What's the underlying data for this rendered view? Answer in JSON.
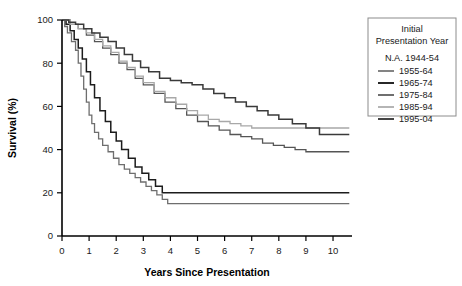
{
  "chart_data": {
    "type": "line",
    "title": "",
    "xlabel": "Years Since Presentation",
    "ylabel": "Survival (%)",
    "xlim": [
      0,
      10.7
    ],
    "ylim": [
      0,
      100
    ],
    "xticks": [
      "0",
      "1",
      "2",
      "3",
      "4",
      "5",
      "6",
      "7",
      "8",
      "9",
      "10"
    ],
    "yticks": [
      "0",
      "20",
      "40",
      "60",
      "80",
      "100"
    ],
    "grid": false,
    "legend_position": "right-outside",
    "legend_title_line1": "Initial",
    "legend_title_line2": "Presentation Year",
    "na_entry": "N.A. 1944-54",
    "series": [
      {
        "name": "1955-64",
        "color": "#6e6e6e",
        "width": 1.3,
        "final_value": 15,
        "x": [
          0,
          0.1,
          0.2,
          0.35,
          0.5,
          0.6,
          0.7,
          0.8,
          0.9,
          1.0,
          1.1,
          1.2,
          1.35,
          1.5,
          1.7,
          1.9,
          2.1,
          2.3,
          2.5,
          2.7,
          2.9,
          3.1,
          3.3,
          3.5,
          3.7,
          3.9,
          10.6
        ],
        "y": [
          100,
          97,
          94,
          90,
          86,
          80,
          74,
          68,
          62,
          56,
          52,
          48,
          45,
          42,
          39,
          36,
          33,
          31,
          29,
          27,
          25,
          23,
          21,
          19,
          17,
          15,
          15
        ]
      },
      {
        "name": "1965-74",
        "color": "#1c1c1c",
        "width": 1.5,
        "final_value": 20,
        "x": [
          0,
          0.15,
          0.3,
          0.45,
          0.6,
          0.75,
          0.9,
          1.05,
          1.2,
          1.4,
          1.6,
          1.8,
          2.0,
          2.2,
          2.45,
          2.7,
          2.95,
          3.2,
          3.45,
          3.7,
          10.6
        ],
        "y": [
          100,
          98,
          95,
          91,
          87,
          82,
          76,
          70,
          64,
          58,
          53,
          48,
          44,
          40,
          36,
          32,
          29,
          26,
          23,
          20,
          20
        ]
      },
      {
        "name": "1975-84",
        "color": "#555555",
        "width": 1.3,
        "final_value": 39,
        "x": [
          0,
          0.3,
          0.6,
          0.9,
          1.2,
          1.5,
          1.8,
          2.1,
          2.4,
          2.7,
          3.0,
          3.4,
          3.8,
          4.2,
          4.6,
          5.0,
          5.4,
          5.8,
          6.2,
          6.6,
          7.0,
          7.4,
          7.8,
          8.2,
          8.6,
          9.0,
          10.6
        ],
        "y": [
          100,
          98,
          96,
          93,
          90,
          87,
          84,
          80,
          77,
          73,
          70,
          66,
          62,
          59,
          56,
          53,
          51,
          49,
          47,
          46,
          45,
          43,
          42,
          41,
          40,
          39,
          39
        ]
      },
      {
        "name": "1985-94",
        "color": "#a8a8a8",
        "width": 1.3,
        "final_value": 50,
        "x": [
          0,
          0.3,
          0.6,
          0.9,
          1.2,
          1.5,
          1.8,
          2.1,
          2.4,
          2.7,
          3.0,
          3.4,
          3.8,
          4.2,
          4.6,
          5.0,
          5.4,
          5.8,
          6.2,
          6.6,
          7.0,
          10.6
        ],
        "y": [
          100,
          98,
          96,
          94,
          91,
          88,
          85,
          81,
          78,
          74,
          71,
          67,
          64,
          61,
          58,
          56,
          54,
          53,
          52,
          51,
          50,
          50
        ]
      },
      {
        "name": "1995-04",
        "color": "#3a3a3a",
        "width": 1.5,
        "final_value": 47,
        "x": [
          0,
          0.25,
          0.5,
          0.8,
          1.1,
          1.4,
          1.7,
          2.0,
          2.3,
          2.6,
          2.9,
          3.2,
          3.6,
          4.0,
          4.4,
          4.8,
          5.2,
          5.6,
          6.0,
          6.4,
          6.8,
          7.2,
          7.6,
          8.0,
          8.5,
          9.0,
          9.5,
          10.6
        ],
        "y": [
          100,
          99,
          98,
          96,
          94,
          92,
          90,
          87,
          84,
          81,
          78,
          76,
          73,
          72,
          71,
          70,
          68,
          66,
          64,
          62,
          60,
          58,
          56,
          54,
          52,
          50,
          47,
          47
        ]
      }
    ]
  }
}
